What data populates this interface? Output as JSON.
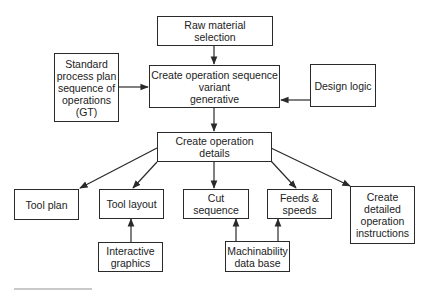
{
  "diagram": {
    "nodes": {
      "raw_material": {
        "lines": [
          "Raw material",
          "selection"
        ]
      },
      "standard_process": {
        "lines": [
          "Standard",
          "process plan",
          "sequence of",
          "operations",
          "(GT)"
        ]
      },
      "op_sequence": {
        "lines": [
          "Create operation sequence",
          "variant",
          "generative"
        ]
      },
      "design_logic": {
        "lines": [
          "Design logic"
        ]
      },
      "op_details": {
        "lines": [
          "Create operation",
          "details"
        ]
      },
      "tool_plan": {
        "lines": [
          "Tool plan"
        ]
      },
      "tool_layout": {
        "lines": [
          "Tool layout"
        ]
      },
      "cut_sequence": {
        "lines": [
          "Cut sequence"
        ]
      },
      "feeds_speeds": {
        "lines": [
          "Feeds &",
          "speeds"
        ]
      },
      "detailed_instructions": {
        "lines": [
          "Create",
          "detailed",
          "operation",
          "instructions"
        ]
      },
      "interactive_graphics": {
        "lines": [
          "Interactive",
          "graphics"
        ]
      },
      "machinability_db": {
        "lines": [
          "Machinability",
          "data base"
        ]
      }
    },
    "edges": [
      {
        "from": "raw_material",
        "to": "op_sequence",
        "style": "solid"
      },
      {
        "from": "standard_process",
        "to": "op_sequence",
        "style": "solid+dashed"
      },
      {
        "from": "design_logic",
        "to": "op_sequence",
        "style": "solid+dashed"
      },
      {
        "from": "op_sequence",
        "to": "op_details",
        "style": "solid"
      },
      {
        "from": "op_details",
        "to": "tool_plan",
        "style": "solid"
      },
      {
        "from": "op_details",
        "to": "tool_layout",
        "style": "solid"
      },
      {
        "from": "op_details",
        "to": "cut_sequence",
        "style": "solid"
      },
      {
        "from": "op_details",
        "to": "feeds_speeds",
        "style": "solid"
      },
      {
        "from": "op_details",
        "to": "detailed_instructions",
        "style": "solid"
      },
      {
        "from": "interactive_graphics",
        "to": "tool_layout",
        "style": "solid"
      },
      {
        "from": "machinability_db",
        "to": "cut_sequence",
        "style": "solid"
      },
      {
        "from": "machinability_db",
        "to": "feeds_speeds",
        "style": "solid"
      }
    ],
    "colors": {
      "line": "#2a2a2a",
      "background": "#ffffff"
    }
  }
}
